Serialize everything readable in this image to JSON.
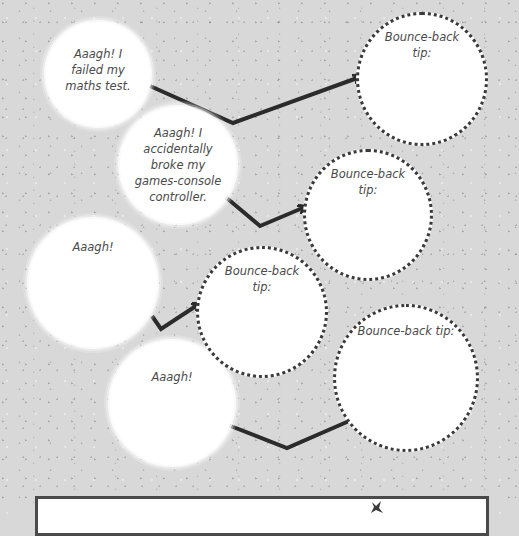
{
  "worksheet": {
    "problems": [
      {
        "text": "Aaagh! I failed my maths test."
      },
      {
        "text": "Aaagh! I accidentally broke my games-console controller."
      },
      {
        "text": "Aaagh!"
      },
      {
        "text": "Aaagh!"
      }
    ],
    "tips": [
      {
        "label": "Bounce-back tip:"
      },
      {
        "label": "Bounce-back tip:"
      },
      {
        "label": "Bounce-back tip:"
      },
      {
        "label": "Bounce-back tip:"
      }
    ],
    "colors": {
      "background": "#d8d8d8",
      "circle_fill": "#ffffff",
      "arrow": "#2b2b2b",
      "dotted_border": "#3a3a3a",
      "text": "#4a4a4a"
    }
  },
  "icons": {
    "star": "star-icon",
    "arrow": "arrow-icon"
  }
}
